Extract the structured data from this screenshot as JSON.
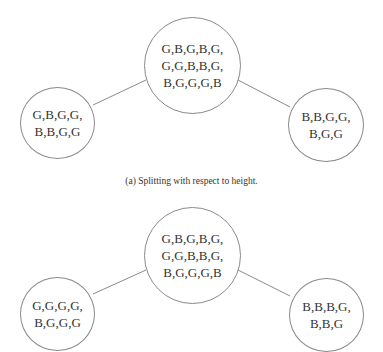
{
  "figure": {
    "panels": [
      {
        "id": "a",
        "caption": "(a) Splitting with respect to height.",
        "root": {
          "lines": [
            "G,B,G,B,G,",
            "G,G,B,B,G,",
            "B,G,G,G,B"
          ]
        },
        "left_child": {
          "lines": [
            "G,B,G,G,",
            "B,B,G,G"
          ]
        },
        "right_child": {
          "lines": [
            "B,B,G,G,",
            "B,G,G"
          ]
        }
      },
      {
        "id": "b",
        "caption": "",
        "root": {
          "lines": [
            "G,B,G,B,G,",
            "G,G,B,B,G,",
            "B,G,G,G,B"
          ]
        },
        "left_child": {
          "lines": [
            "G,G,G,G,",
            "B,G,G,G"
          ]
        },
        "right_child": {
          "lines": [
            "B,B,B,G,",
            "B,B,G"
          ]
        }
      }
    ],
    "colors": {
      "stroke": "#8a8a8a",
      "text": "#333333",
      "background": "#ffffff"
    }
  }
}
